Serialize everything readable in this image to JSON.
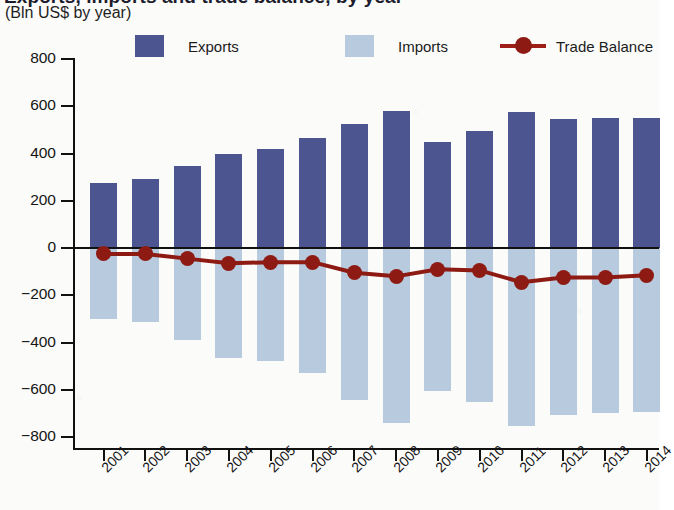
{
  "title": {
    "main": "Exports, imports and trade balance, by year",
    "sub": "(Bln US$ by year)"
  },
  "legend": {
    "exports": "Exports",
    "imports": "Imports",
    "balance": "Trade Balance"
  },
  "colors": {
    "exports": "#4d5590",
    "imports": "#b8cade",
    "balance": "#8e1b13",
    "axis": "#111111",
    "background": "#fbfbfa"
  },
  "axes": {
    "y_label": "",
    "y_ticks": [
      "800",
      "600",
      "400",
      "200",
      "0",
      "−200",
      "−400",
      "−600",
      "−800"
    ],
    "x_ticks": [
      "2001",
      "2002",
      "2003",
      "2004",
      "2005",
      "2006",
      "2007",
      "2008",
      "2009",
      "2010",
      "2011",
      "2012",
      "2013",
      "2014"
    ]
  },
  "chart_data": {
    "type": "bar",
    "title": "Exports, imports and trade balance, by year",
    "subtitle": "(Bln US$ by year)",
    "xlabel": "",
    "ylabel": "Bln US$",
    "ylim": [
      -800,
      800
    ],
    "ytick_step": 200,
    "grid": false,
    "legend_position": "top",
    "categories": [
      "2001",
      "2002",
      "2003",
      "2004",
      "2005",
      "2006",
      "2007",
      "2008",
      "2009",
      "2010",
      "2011",
      "2012",
      "2013",
      "2014"
    ],
    "series": [
      {
        "name": "Exports",
        "type": "bar",
        "color": "#4d5590",
        "values": [
          275,
          290,
          345,
          400,
          420,
          465,
          525,
          580,
          450,
          495,
          575,
          545,
          550,
          550
        ]
      },
      {
        "name": "Imports",
        "type": "bar",
        "color": "#b8cade",
        "values": [
          -300,
          -315,
          -390,
          -465,
          -480,
          -530,
          -645,
          -740,
          -605,
          -650,
          -755,
          -705,
          -700,
          -695
        ]
      },
      {
        "name": "Trade Balance",
        "type": "line",
        "color": "#8e1b13",
        "values": [
          -25,
          -25,
          -45,
          -65,
          -60,
          -60,
          -105,
          -120,
          -90,
          -95,
          -145,
          -125,
          -125,
          -115
        ]
      }
    ]
  }
}
